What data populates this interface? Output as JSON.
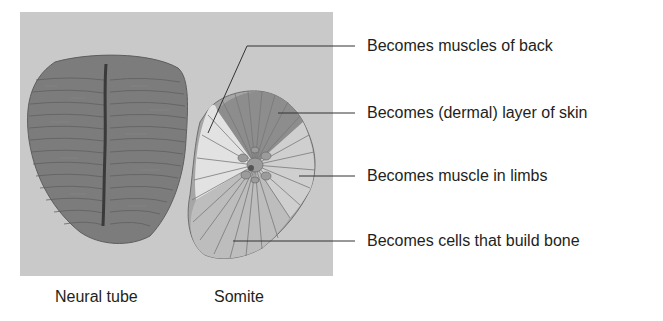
{
  "figure": {
    "captions": {
      "neural_tube": "Neural tube",
      "somite": "Somite"
    },
    "labels": [
      {
        "id": "back-muscles",
        "text": "Becomes muscles of back"
      },
      {
        "id": "dermis",
        "text": "Becomes (dermal) layer of skin"
      },
      {
        "id": "limb-muscle",
        "text": "Becomes muscle in limbs"
      },
      {
        "id": "bone-cells",
        "text": "Becomes cells that build bone"
      }
    ],
    "colors": {
      "panel_background": "#c9c9c9",
      "neural_tube_fill": "#7a7a7a",
      "somite_dark": "#8e8e8e",
      "somite_mid": "#a9a9a9",
      "somite_light": "#dcdcdc",
      "leader_line": "#333333"
    }
  }
}
